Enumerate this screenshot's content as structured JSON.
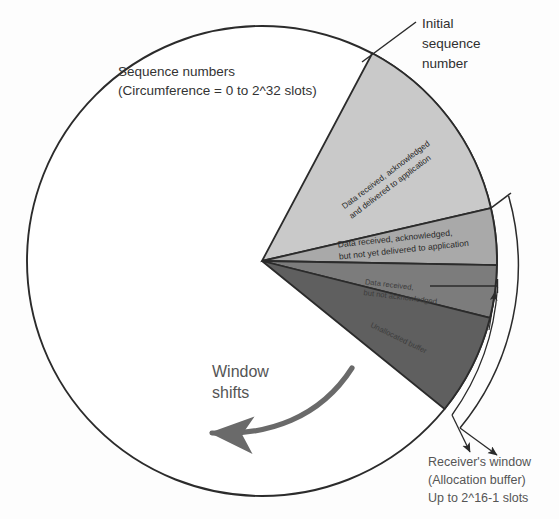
{
  "figure": {
    "type": "diagram"
  },
  "labels": {
    "sequence_numbers_line1": "Sequence numbers",
    "sequence_numbers_line2": "(Circumference = 0 to 2^32 slots)",
    "initial_seq_line1": "Initial",
    "initial_seq_line2": "sequence",
    "initial_seq_line3": "number",
    "window_shifts_line1": "Window",
    "window_shifts_line2": "shifts",
    "receiver_window_line1": "Receiver's window",
    "receiver_window_line2": "(Allocation buffer)",
    "receiver_window_line3": "Up to 2^16-1 slots"
  },
  "sectors": [
    {
      "id": "delivered",
      "text_line1": "Data received, acknowledged",
      "text_line2": "and delivered to application",
      "color": "#c9c9c9",
      "start_deg": -62,
      "end_deg": -13,
      "text_rotation_deg": -37
    },
    {
      "id": "acked-not-delivered",
      "text_line1": "Data received, acknowledged,",
      "text_line2": "but not yet delivered to application",
      "color": "#a9a9a9",
      "start_deg": -13,
      "end_deg": 1,
      "text_rotation_deg": -6
    },
    {
      "id": "received-not-acked",
      "text_line1": "Data received,",
      "text_line2": "but not acknowledged",
      "color": "#7c7c7c",
      "start_deg": 1,
      "end_deg": 14,
      "text_rotation_deg": 7
    },
    {
      "id": "unallocated-buffer",
      "text_line1": "Unallocated buffer",
      "text_line2": "",
      "color": "#5f5f5f",
      "start_deg": 14,
      "end_deg": 39,
      "text_rotation_deg": 26
    }
  ],
  "geometry": {
    "center_x": 262,
    "center_y": 261,
    "radius": 235,
    "circle_stroke": "#2b2b2b",
    "circle_fill": "#ffffff"
  },
  "brackets": {
    "outer_label": "Receiver's window",
    "inner_label": "Allocation buffer span"
  },
  "colors": {
    "ink": "#2b2b2b",
    "text": "#3a3a3a",
    "page_background": "#ffffff"
  }
}
